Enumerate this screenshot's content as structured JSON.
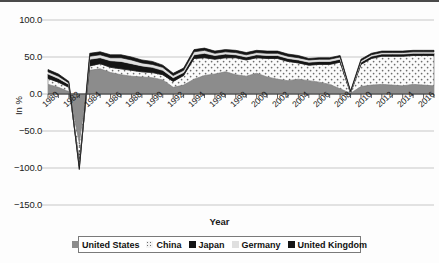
{
  "chart_data": {
    "type": "area",
    "stacked": true,
    "title": "",
    "xlabel": "Year",
    "ylabel": "In %",
    "ylim": [
      -150,
      100
    ],
    "yticks": [
      100.0,
      50.0,
      0.0,
      -50.0,
      -100.0,
      -150.0
    ],
    "ytick_labels": [
      "100.0",
      "50.0",
      "0.0",
      "-50.0",
      "-100.0",
      "-150.0"
    ],
    "xlim": [
      1980,
      2017
    ],
    "xticks": [
      1980,
      1982,
      1984,
      1986,
      1988,
      1990,
      1992,
      1994,
      1996,
      1998,
      2000,
      2002,
      2004,
      2006,
      2008,
      2010,
      2012,
      2014,
      2016
    ],
    "xtick_labels": [
      "1980",
      "1982",
      "1984",
      "1986",
      "1988",
      "1990",
      "1992",
      "1994",
      "1996",
      "1998",
      "2000",
      "2002",
      "2004",
      "2006",
      "2008",
      "2010",
      "2012",
      "2014",
      "2016"
    ],
    "grid": true,
    "legend_position": "bottom",
    "x": [
      1980,
      1981,
      1982,
      1983,
      1984,
      1985,
      1986,
      1987,
      1988,
      1989,
      1990,
      1991,
      1992,
      1993,
      1994,
      1995,
      1996,
      1997,
      1998,
      1999,
      2000,
      2001,
      2002,
      2003,
      2004,
      2005,
      2006,
      2007,
      2008,
      2009,
      2010,
      2011,
      2012,
      2013,
      2014,
      2015,
      2016,
      2017
    ],
    "series": [
      {
        "name": "United States",
        "color": "#8c8c8c",
        "pattern": "solid",
        "values": [
          13.0,
          9.0,
          3.0,
          -66.0,
          32.0,
          34.0,
          29.0,
          26.0,
          24.0,
          23.0,
          22.0,
          19.0,
          9.0,
          12.0,
          20.0,
          25.0,
          27.0,
          30.0,
          26.0,
          24.0,
          28.0,
          23.0,
          20.0,
          18.0,
          20.0,
          18.0,
          16.0,
          13.0,
          7.0,
          1.0,
          10.0,
          12.0,
          13.0,
          12.0,
          11.0,
          13.0,
          12.0,
          11.0
        ]
      },
      {
        "name": "China",
        "color": "#f2f2f2",
        "pattern": "dotted",
        "values": [
          8.0,
          7.0,
          6.0,
          -26.0,
          6.0,
          7.0,
          7.0,
          8.0,
          8.0,
          7.0,
          7.0,
          7.0,
          8.0,
          13.0,
          28.0,
          24.0,
          20.0,
          19.0,
          23.0,
          22.0,
          21.0,
          25.0,
          28.0,
          26.0,
          22.0,
          21.0,
          24.0,
          27.0,
          36.0,
          0.0,
          30.0,
          36.0,
          38.0,
          39.0,
          40.0,
          39.0,
          40.0,
          41.0
        ]
      },
      {
        "name": "Japan",
        "color": "#151515",
        "pattern": "solid",
        "values": [
          6.0,
          5.0,
          4.0,
          -6.0,
          9.0,
          8.0,
          9.0,
          10.0,
          9.0,
          8.0,
          7.0,
          6.0,
          5.0,
          4.0,
          5.0,
          6.0,
          5.0,
          5.0,
          4.0,
          4.0,
          4.0,
          4.0,
          4.0,
          4.0,
          4.0,
          4.0,
          4.0,
          4.0,
          4.0,
          1.0,
          3.0,
          3.0,
          3.0,
          3.0,
          3.0,
          3.0,
          3.0,
          3.0
        ]
      },
      {
        "name": "Germany",
        "color": "#e0e0e0",
        "pattern": "solid",
        "values": [
          3.0,
          3.0,
          2.0,
          -2.0,
          4.0,
          4.0,
          4.0,
          5.0,
          5.0,
          4.0,
          4.0,
          4.0,
          3.0,
          3.0,
          4.0,
          4.0,
          3.0,
          3.0,
          3.0,
          3.0,
          3.0,
          3.0,
          3.0,
          3.0,
          3.0,
          3.0,
          3.0,
          3.0,
          3.0,
          1.0,
          2.0,
          2.0,
          2.0,
          2.0,
          2.0,
          2.0,
          2.0,
          2.0
        ]
      },
      {
        "name": "United Kingdom",
        "color": "#151515",
        "pattern": "solid",
        "values": [
          3.0,
          3.0,
          2.0,
          -2.0,
          4.0,
          4.0,
          4.0,
          4.0,
          4.0,
          4.0,
          4.0,
          3.0,
          3.0,
          3.0,
          3.0,
          3.0,
          3.0,
          3.0,
          3.0,
          3.0,
          3.0,
          3.0,
          3.0,
          3.0,
          3.0,
          2.0,
          2.0,
          2.0,
          2.0,
          1.0,
          2.0,
          2.0,
          2.0,
          2.0,
          2.0,
          2.0,
          2.0,
          2.0
        ]
      }
    ]
  },
  "legend": {
    "items": [
      {
        "label": "United States"
      },
      {
        "label": "China"
      },
      {
        "label": "Japan"
      },
      {
        "label": "Germany"
      },
      {
        "label": "United Kingdom"
      }
    ]
  },
  "axes": {
    "y_title": "In %",
    "x_title": "Year"
  }
}
